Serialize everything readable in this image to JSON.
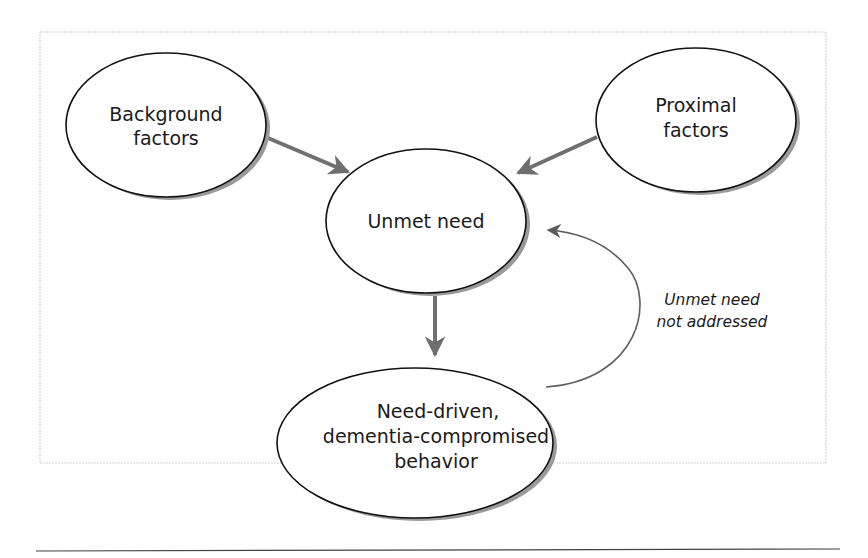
{
  "diagram": {
    "nodes": [
      {
        "id": "background",
        "lines": [
          "Background",
          "factors"
        ]
      },
      {
        "id": "proximal",
        "lines": [
          "Proximal",
          "factors"
        ]
      },
      {
        "id": "unmet",
        "lines": [
          "Unmet need"
        ]
      },
      {
        "id": "behavior",
        "lines": [
          "Need-driven,",
          "dementia-compromised",
          "behavior"
        ]
      }
    ],
    "edges": [
      {
        "from": "background",
        "to": "unmet"
      },
      {
        "from": "proximal",
        "to": "unmet"
      },
      {
        "from": "unmet",
        "to": "behavior"
      },
      {
        "from": "behavior",
        "to": "unmet",
        "label": "Unmet need not addressed"
      }
    ],
    "feedback_label": [
      "Unmet need",
      "not addressed"
    ],
    "colors": {
      "arrow": "#6e6e6e",
      "outline": "#111111",
      "shadow": "#9a9a9a",
      "frame": "#d0d0d0"
    }
  }
}
